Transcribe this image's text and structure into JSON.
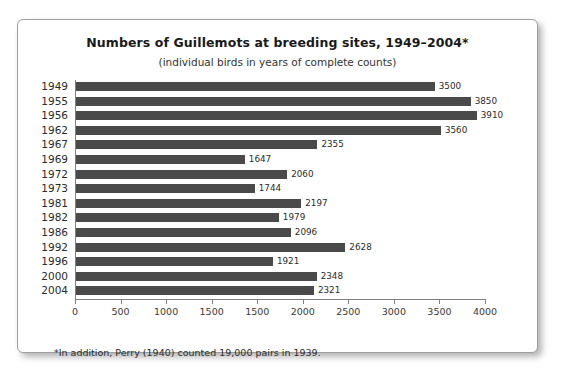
{
  "chart_data": {
    "type": "bar",
    "orientation": "horizontal",
    "title": "Numbers of Guillemots at breeding sites, 1949–2004*",
    "subtitle": "(individual birds in years of complete counts)",
    "xlabel": "",
    "ylabel": "",
    "xlim": [
      0,
      4000
    ],
    "grid": false,
    "legend": null,
    "categories": [
      "1949",
      "1955",
      "1956",
      "1962",
      "1967",
      "1969",
      "1972",
      "1973",
      "1981",
      "1982",
      "1986",
      "1992",
      "1996",
      "2000",
      "2004"
    ],
    "values": [
      3500,
      3850,
      3910,
      3560,
      2355,
      1647,
      2060,
      1744,
      2197,
      1979,
      2096,
      2628,
      1921,
      2348,
      2321
    ],
    "value_labels": [
      "3500",
      "3850",
      "3910",
      "3560",
      "2355",
      "1647",
      "2060",
      "1744",
      "2197",
      "1979",
      "2096",
      "2628",
      "1921",
      "2348",
      "2321"
    ],
    "xtick_values": [
      0,
      500,
      1000,
      1500,
      2000,
      2500,
      3000,
      3500,
      4000
    ],
    "xtick_labels": [
      "0",
      "500",
      "1000",
      "1500",
      "1500",
      "2000",
      "2500",
      "3000",
      "3500",
      "4000"
    ],
    "bar_color": "#4a4a4a",
    "annotation": "*In addition, Perry (1940) counted 19,000 pairs in 1939."
  }
}
